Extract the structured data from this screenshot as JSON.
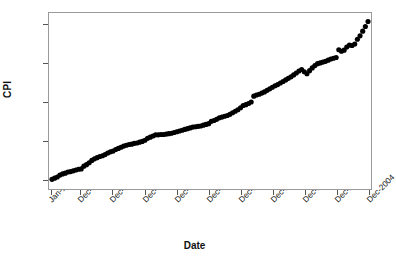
{
  "chart_data": {
    "type": "scatter",
    "title": "",
    "xlabel": "Date",
    "ylabel": "CPI",
    "grid": false,
    "legend": null,
    "marker": {
      "shape": "circle",
      "color": "#000000",
      "size": 2.6
    },
    "ylim": [
      147.5,
      193
    ],
    "yticks": [
      150,
      160,
      170,
      180,
      190
    ],
    "ytick_labels": [
      "150",
      "160",
      "170",
      "180",
      "190"
    ],
    "xticks": [
      "Jan-1995",
      "Dec-1995",
      "Dec-1996",
      "Dec-1997",
      "Dec-1998",
      "Dec-1999",
      "Dec-2000",
      "Dec-2001",
      "Dec-2002",
      "Dec-2003",
      "Dec-2004"
    ],
    "xtick_label_rotation": -45,
    "x_index_of_ticks": [
      0,
      11,
      23,
      35,
      47,
      59,
      71,
      83,
      95,
      107,
      119
    ],
    "n_points": 120,
    "x_start": "Jan-1995",
    "x_end": "Dec-2004",
    "x_frequency": "monthly",
    "values": [
      150.0,
      150.3,
      150.6,
      151.1,
      151.4,
      151.6,
      151.9,
      152.0,
      152.2,
      152.4,
      152.6,
      152.7,
      153.4,
      153.8,
      154.3,
      154.9,
      155.3,
      155.6,
      155.9,
      156.1,
      156.4,
      156.8,
      157.1,
      157.3,
      157.7,
      158.0,
      158.3,
      158.6,
      158.8,
      159.0,
      159.1,
      159.3,
      159.4,
      159.6,
      159.8,
      160.1,
      160.6,
      160.9,
      161.2,
      161.5,
      161.5,
      161.6,
      161.6,
      161.7,
      161.8,
      161.9,
      162.1,
      162.3,
      162.5,
      162.7,
      162.9,
      163.1,
      163.3,
      163.5,
      163.6,
      163.7,
      163.8,
      164.0,
      164.2,
      164.4,
      165.0,
      165.2,
      165.5,
      165.9,
      166.1,
      166.3,
      166.5,
      166.8,
      167.2,
      167.6,
      168.0,
      168.5,
      169.1,
      169.3,
      169.6,
      170.0,
      171.5,
      171.8,
      172.0,
      172.3,
      172.6,
      173.0,
      173.4,
      173.8,
      174.2,
      174.5,
      174.9,
      175.3,
      175.7,
      176.1,
      176.5,
      177.0,
      177.5,
      178.0,
      178.4,
      177.8,
      177.3,
      178.1,
      178.8,
      179.4,
      179.9,
      180.1,
      180.3,
      180.5,
      180.8,
      181.1,
      181.3,
      181.5,
      183.5,
      183.1,
      183.4,
      184.2,
      184.7,
      184.6,
      185.0,
      186.2,
      187.1,
      188.3,
      189.5,
      190.8
    ]
  },
  "axes": {
    "y_title": "CPI",
    "x_title": "Date"
  }
}
